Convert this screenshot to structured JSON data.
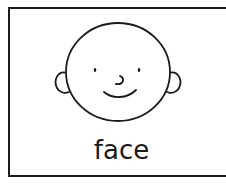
{
  "card": {
    "caption": "face",
    "illustration": "face-drawing",
    "stroke_color": "#1a1a1a",
    "background_color": "#ffffff"
  }
}
